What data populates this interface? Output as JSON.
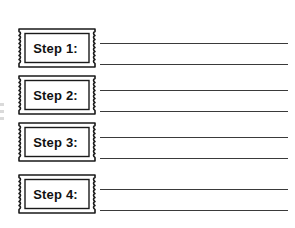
{
  "worksheet": {
    "title": "Steps Worksheet",
    "line_color": "#3a3a3a",
    "ticket_border_color": "#1a1a1a",
    "text_color": "#111111",
    "background_color": "#ffffff",
    "steps": [
      {
        "label": "Step 1:",
        "lines": [
          "",
          ""
        ]
      },
      {
        "label": "Step 2:",
        "lines": [
          "",
          ""
        ]
      },
      {
        "label": "Step 3:",
        "lines": [
          "",
          ""
        ]
      },
      {
        "label": "Step 4:",
        "lines": [
          "",
          ""
        ]
      }
    ]
  }
}
